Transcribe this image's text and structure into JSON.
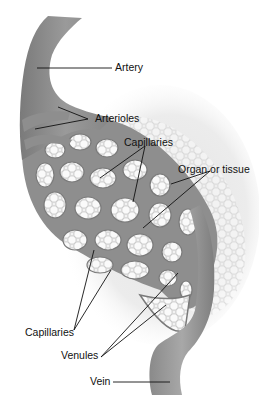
{
  "diagram": {
    "colors": {
      "vessel": "#8e8e8e",
      "vessel_dark": "#6f6f6f",
      "vessel_light": "#b2b2b2",
      "tissue": "#e6e6e6",
      "cell_outline": "#c8c8c8",
      "leader_line": "#111111"
    },
    "labels": {
      "artery": "Artery",
      "arterioles": "Arterioles",
      "capillaries_top": "Capillaries",
      "organ_or_tissue": "Organ or tissue",
      "capillaries_bottom": "Capillaries",
      "venules": "Venules",
      "vein": "Vein"
    }
  }
}
